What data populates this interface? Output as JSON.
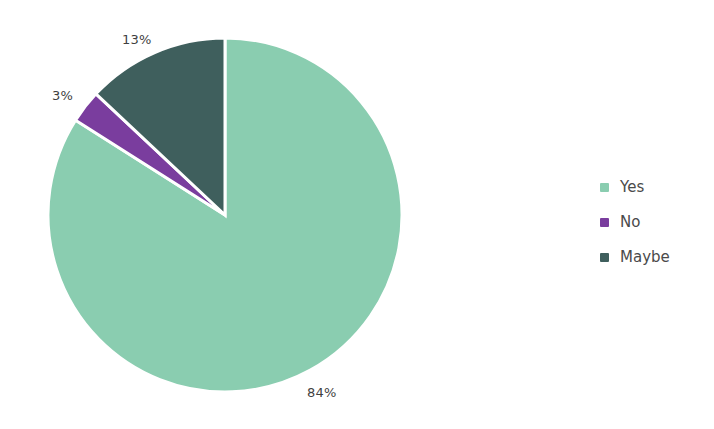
{
  "chart_data": {
    "type": "pie",
    "title": "",
    "categories": [
      "Yes",
      "No",
      "Maybe"
    ],
    "values": [
      84,
      3,
      13
    ],
    "value_unit": "%",
    "data_labels": [
      "84%",
      "3%",
      "13%"
    ],
    "colors": [
      "#8acdb0",
      "#7a3d9e",
      "#3f5f5d"
    ],
    "start_angle_deg": 0,
    "direction": "clockwise",
    "legend_position": "right",
    "grid": false,
    "slice_separator_color": "#ffffff",
    "label_text_color": "#3f3f3f",
    "background_color": "#ffffff",
    "slices": [
      {
        "label": "Yes",
        "value": 84,
        "display": "84%",
        "color": "#8acdb0"
      },
      {
        "label": "No",
        "value": 3,
        "display": "3%",
        "color": "#7a3d9e"
      },
      {
        "label": "Maybe",
        "value": 13,
        "display": "13%",
        "color": "#3f5f5d"
      }
    ]
  },
  "legend": {
    "items": [
      {
        "label": "Yes",
        "color": "#8acdb0"
      },
      {
        "label": "No",
        "color": "#7a3d9e"
      },
      {
        "label": "Maybe",
        "color": "#3f5f5d"
      }
    ]
  }
}
